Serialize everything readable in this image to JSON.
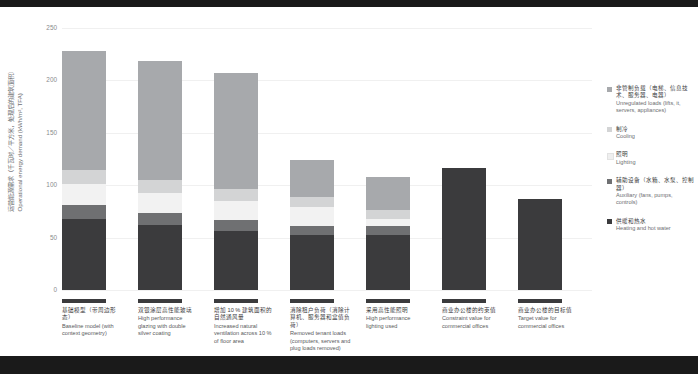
{
  "chart_data": {
    "type": "bar",
    "title": "",
    "xlabel": "",
    "ylabel": "Operational energy demand (kWh/m², TFA)",
    "ylabel_cn": "运营能源需求（千瓦时／平方米，处理后的建筑面积）",
    "ylim": [
      0,
      250
    ],
    "yticks": [
      0,
      50,
      100,
      150,
      200,
      250
    ],
    "ytick_labels": [
      "0",
      "50",
      "100",
      "150",
      "200",
      "250"
    ],
    "grid": true,
    "legend_position": "right",
    "stacked": true,
    "categories": [
      "Baseline model (with context geometry)",
      "High performance glazing with double silver coating",
      "Increased natural ventilation across 10 % of floor area",
      "Removed tenant loads (computers, servers and plug loads removed)",
      "High performance lighting used",
      "Constraint value for commercial offices",
      "Target value for commercial offices"
    ],
    "categories_cn": [
      "基础模型（带周边形态）",
      "双银涂层高性能玻璃",
      "增加 10 % 建筑面积的自然通风量",
      "消除租户负荷（消除计算机、服务器和盒值负荷）",
      "采用高性能照明",
      "商业办公楼的约束值",
      "商业办公楼的目标值"
    ],
    "series": [
      {
        "name": "Heating and hot water",
        "name_cn": "供暖和热水",
        "color": "#3b3b3d",
        "values": [
          63,
          57,
          52,
          49,
          49,
          108,
          80
        ]
      },
      {
        "name": "Auxiliary (fans, pumps, controls)",
        "name_cn": "辅助设备（水箱、水泵、控制器）",
        "color": "#6f7072",
        "values": [
          12,
          11,
          10,
          8,
          8,
          0,
          0
        ]
      },
      {
        "name": "Lighting",
        "name_cn": "照明",
        "color": "#f2f2f2",
        "values": [
          19,
          18,
          17,
          16,
          6,
          0,
          0
        ]
      },
      {
        "name": "Cooling",
        "name_cn": "制冷",
        "color": "#d3d4d5",
        "values": [
          12,
          11,
          10,
          9,
          8,
          0,
          0
        ]
      },
      {
        "name": "Unregulated loads (lifts, it, servers, appliances)",
        "name_cn": "非管制负载（电梯、信息技术、服务器、电器）",
        "color": "#a7a9ac",
        "values": [
          105,
          105,
          103,
          33,
          29,
          0,
          0
        ]
      }
    ],
    "totals": [
      211,
      202,
      192,
      115,
      100,
      108,
      80
    ]
  },
  "axis": {
    "y_label_cn": "运营能源需求（千瓦时／平方米，处理后的建筑面积）",
    "y_label_en": "Operational energy demand (kWh/m², TFA)",
    "ticks": [
      "250",
      "200",
      "150",
      "100",
      "50",
      "0"
    ]
  },
  "categories": [
    {
      "cn": "基础模型（带周边形态）",
      "en": "Baseline model (with context geometry)"
    },
    {
      "cn": "双银涂层高性能玻璃",
      "en": "High performance glazing with double silver coating"
    },
    {
      "cn": "增加 10 % 建筑面积的自然通风量",
      "en": "Increased natural ventilation across 10 % of floor area"
    },
    {
      "cn": "消除租户负荷（消除计算机、服务器和盒值负荷）",
      "en": "Removed tenant loads (computers, servers and plug loads removed)"
    },
    {
      "cn": "采用高性能照明",
      "en": "High performance lighting used"
    },
    {
      "cn": "商业办公楼的约束值",
      "en": "Constraint value for commercial offices"
    },
    {
      "cn": "商业办公楼的目标值",
      "en": "Target value for commercial offices"
    }
  ],
  "legend": [
    {
      "cn": "非管制负载（电梯、信息技术、服务器、电器）",
      "en": "Unregulated loads (lifts, it, servers, appliances)",
      "color": "#a7a9ac"
    },
    {
      "cn": "制冷",
      "en": "Cooling",
      "color": "#d3d4d5"
    },
    {
      "cn": "照明",
      "en": "Lighting",
      "color": "#efefef"
    },
    {
      "cn": "辅助设备（水箱、水泵、控制器）",
      "en": "Auxiliary (fans, pumps, controls)",
      "color": "#6f7072"
    },
    {
      "cn": "供暖和热水",
      "en": "Heating and hot water",
      "color": "#3b3b3d"
    }
  ],
  "colors": {
    "band": "#1a1a1a",
    "background": "#ffffff",
    "grid": "#f0f0f0",
    "text": "#58595b"
  }
}
